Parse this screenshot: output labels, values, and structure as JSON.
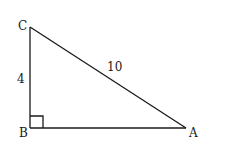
{
  "diagram": {
    "type": "right-triangle",
    "vertices": [
      {
        "label": "C",
        "x": 30,
        "y": 27
      },
      {
        "label": "B",
        "x": 30,
        "y": 128
      },
      {
        "label": "A",
        "x": 186,
        "y": 128
      }
    ],
    "right_angle_at": "B",
    "side_labels": {
      "BC": "4",
      "CA": "10"
    },
    "stroke_color": "#1a1a1a",
    "background": "#ffffff"
  }
}
